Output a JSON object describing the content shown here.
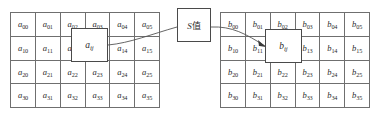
{
  "diagram": {
    "left_matrix": {
      "name": "matrix-a",
      "rows": 4,
      "cols": 6,
      "cells": [
        [
          "a00",
          "a01",
          "a02",
          "a03",
          "a04",
          "a05"
        ],
        [
          "a10",
          "a11",
          "a12",
          "a13",
          "a14",
          "a15"
        ],
        [
          "a20",
          "a21",
          "a22",
          "a23",
          "a24",
          "a25"
        ],
        [
          "a30",
          "a31",
          "a32",
          "a33",
          "a34",
          "a35"
        ]
      ],
      "cell_labels": [
        [
          {
            "base": "a",
            "sub": "00"
          },
          {
            "base": "a",
            "sub": "01"
          },
          {
            "base": "a",
            "sub": "02"
          },
          {
            "base": "a",
            "sub": "03"
          },
          {
            "base": "a",
            "sub": "04"
          },
          {
            "base": "a",
            "sub": "05"
          }
        ],
        [
          {
            "base": "a",
            "sub": "10"
          },
          {
            "base": "a",
            "sub": "11"
          },
          {
            "base": "a",
            "sub": "12"
          },
          {
            "base": "a",
            "sub": "13"
          },
          {
            "base": "a",
            "sub": "14"
          },
          {
            "base": "a",
            "sub": "15"
          }
        ],
        [
          {
            "base": "a",
            "sub": "20"
          },
          {
            "base": "a",
            "sub": "21"
          },
          {
            "base": "a",
            "sub": "22"
          },
          {
            "base": "a",
            "sub": "23"
          },
          {
            "base": "a",
            "sub": "24"
          },
          {
            "base": "a",
            "sub": "25"
          }
        ],
        [
          {
            "base": "a",
            "sub": "30"
          },
          {
            "base": "a",
            "sub": "31"
          },
          {
            "base": "a",
            "sub": "32"
          },
          {
            "base": "a",
            "sub": "33"
          },
          {
            "base": "a",
            "sub": "34"
          },
          {
            "base": "a",
            "sub": "35"
          }
        ]
      ]
    },
    "right_matrix": {
      "name": "matrix-b",
      "rows": 4,
      "cols": 6,
      "cells": [
        [
          "b00",
          "b01",
          "b02",
          "b03",
          "b04",
          "b05"
        ],
        [
          "b10",
          "b11",
          "b12",
          "b13",
          "b14",
          "b15"
        ],
        [
          "b20",
          "b21",
          "b22",
          "b23",
          "b24",
          "b25"
        ],
        [
          "b30",
          "b31",
          "b32",
          "b33",
          "b34",
          "b35"
        ]
      ],
      "cell_labels": [
        [
          {
            "base": "b",
            "sub": "00"
          },
          {
            "base": "b",
            "sub": "01"
          },
          {
            "base": "b",
            "sub": "02"
          },
          {
            "base": "b",
            "sub": "03"
          },
          {
            "base": "b",
            "sub": "04"
          },
          {
            "base": "b",
            "sub": "05"
          }
        ],
        [
          {
            "base": "b",
            "sub": "10"
          },
          {
            "base": "b",
            "sub": "11"
          },
          {
            "base": "b",
            "sub": "12"
          },
          {
            "base": "b",
            "sub": "13"
          },
          {
            "base": "b",
            "sub": "14"
          },
          {
            "base": "b",
            "sub": "15"
          }
        ],
        [
          {
            "base": "b",
            "sub": "20"
          },
          {
            "base": "b",
            "sub": "21"
          },
          {
            "base": "b",
            "sub": "22"
          },
          {
            "base": "b",
            "sub": "23"
          },
          {
            "base": "b",
            "sub": "24"
          },
          {
            "base": "b",
            "sub": "25"
          }
        ],
        [
          {
            "base": "b",
            "sub": "30"
          },
          {
            "base": "b",
            "sub": "31"
          },
          {
            "base": "b",
            "sub": "32"
          },
          {
            "base": "b",
            "sub": "33"
          },
          {
            "base": "b",
            "sub": "34"
          },
          {
            "base": "b",
            "sub": "35"
          }
        ]
      ]
    },
    "popout_a": {
      "base": "a",
      "sub": "ij",
      "full": "aij"
    },
    "popout_b": {
      "base": "b",
      "sub": "ij",
      "full": "bij"
    },
    "operator_box": {
      "latin": "S",
      "cjk": "值",
      "full": "S值"
    },
    "colors": {
      "grid_line": "#6f6f6f",
      "box_border": "#4a4a4a",
      "connector": "#555555",
      "text": "#2b2b2b",
      "background": "#ffffff"
    },
    "connector": {
      "from": "popout-a",
      "through": "operator-box",
      "to": "popout-b",
      "arrowhead": "at popout-b"
    }
  }
}
